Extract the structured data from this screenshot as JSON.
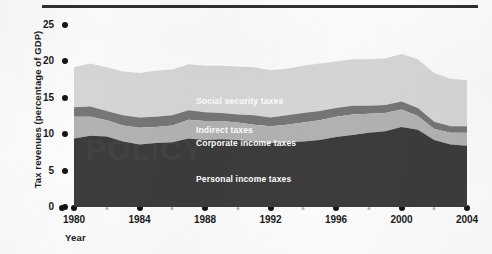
{
  "axes": {
    "y_title": "Tax revenues (percentage of GDP)",
    "x_title": "Year",
    "y_ticks": [
      "0",
      "5",
      "10",
      "15",
      "20",
      "25"
    ],
    "x_ticks": [
      "1980",
      "1984",
      "1988",
      "1992",
      "1996",
      "2000",
      "2004"
    ]
  },
  "labels": {
    "social_security": "Social security taxes",
    "indirect": "Indirect taxes",
    "corporate": "Corporate income taxes",
    "personal": "Personal income taxes"
  },
  "colors": {
    "personal": "#3c3c3c",
    "corporate": "#b2b2b2",
    "indirect": "#767676",
    "social_security": "#d6d6d6",
    "axis_text": "#1a1a1a",
    "rule": "#2f2f2f",
    "page_bg": "#fbfbfb"
  },
  "chart_data": {
    "type": "area",
    "title": "",
    "xlabel": "Year",
    "ylabel": "Tax revenues (percentage of GDP)",
    "xlim": [
      1980,
      2004
    ],
    "ylim": [
      0,
      25
    ],
    "grid": false,
    "stacked": true,
    "legend_position": "inline-annotations",
    "x": [
      1980,
      1981,
      1982,
      1983,
      1984,
      1985,
      1986,
      1987,
      1988,
      1989,
      1990,
      1991,
      1992,
      1993,
      1994,
      1995,
      1996,
      1997,
      1998,
      1999,
      2000,
      2001,
      2002,
      2003,
      2004
    ],
    "series": [
      {
        "name": "Personal income taxes",
        "values": [
          9.4,
          9.8,
          9.7,
          9.0,
          8.6,
          8.8,
          8.9,
          9.4,
          9.2,
          9.3,
          9.2,
          9.0,
          8.8,
          8.9,
          9.0,
          9.2,
          9.6,
          9.9,
          10.2,
          10.4,
          11.0,
          10.6,
          9.2,
          8.6,
          8.4
        ]
      },
      {
        "name": "Corporate income taxes",
        "values": [
          3.0,
          2.6,
          2.2,
          2.2,
          2.3,
          2.2,
          2.3,
          2.6,
          2.6,
          2.5,
          2.4,
          2.3,
          2.3,
          2.4,
          2.6,
          2.7,
          2.8,
          2.8,
          2.6,
          2.5,
          2.4,
          1.9,
          1.5,
          1.6,
          1.8
        ]
      },
      {
        "name": "Indirect taxes",
        "values": [
          1.3,
          1.4,
          1.3,
          1.4,
          1.4,
          1.4,
          1.4,
          1.3,
          1.2,
          1.1,
          1.1,
          1.3,
          1.2,
          1.3,
          1.3,
          1.3,
          1.2,
          1.2,
          1.1,
          1.1,
          1.1,
          1.1,
          1.0,
          0.9,
          0.9
        ]
      },
      {
        "name": "Social security taxes",
        "values": [
          5.5,
          5.9,
          6.0,
          6.0,
          6.1,
          6.3,
          6.3,
          6.3,
          6.4,
          6.5,
          6.6,
          6.6,
          6.5,
          6.4,
          6.5,
          6.5,
          6.4,
          6.4,
          6.4,
          6.4,
          6.5,
          6.7,
          6.7,
          6.5,
          6.3
        ]
      }
    ],
    "totals": [
      19.2,
      19.7,
      19.2,
      18.6,
      18.4,
      18.7,
      18.9,
      19.6,
      19.4,
      19.4,
      19.3,
      19.2,
      18.8,
      19.0,
      19.4,
      19.7,
      20.0,
      20.3,
      20.3,
      20.4,
      21.0,
      20.3,
      18.4,
      17.6,
      17.4
    ]
  },
  "watermark": "POLICY"
}
